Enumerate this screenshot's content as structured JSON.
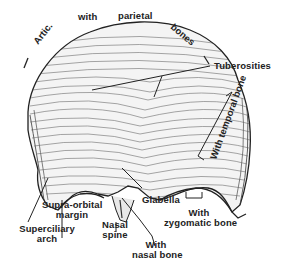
{
  "figure": {
    "labels": {
      "artic": "Artic.",
      "with_top": "with",
      "parietal": "parietal",
      "bones": "bones",
      "tuberosities": "Tuberosities",
      "with_temporal_bone": "With temporal bone",
      "glabella": "Glabella",
      "supra_orbital_1": "Supra-orbital",
      "supra_orbital_2": "margin",
      "superciliary_1": "Superciliary",
      "superciliary_2": "arch",
      "nasal_spine_1": "Nasal",
      "nasal_spine_2": "spine",
      "with_nasal_1": "With",
      "with_nasal_2": "nasal bone",
      "with_zygomatic_1": "With",
      "with_zygomatic_2": "zygomatic bone"
    },
    "colors": {
      "ink": "#222222",
      "bone_fill": "#f4f4f4",
      "background": "#ffffff"
    }
  }
}
